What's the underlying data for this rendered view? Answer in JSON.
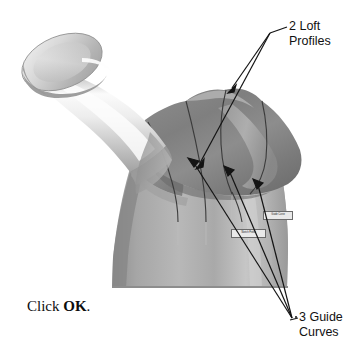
{
  "figure": {
    "background_color": "#ffffff",
    "line_color": "#141414"
  },
  "callouts": [
    {
      "name": "loft-profiles",
      "line1": "2 Loft",
      "line2": "Profiles",
      "count": 2,
      "position": "top-right"
    },
    {
      "name": "guide-curves",
      "line1": "3 Guide",
      "line2": "Curves",
      "count": 3,
      "position": "bottom-right"
    }
  ],
  "instruction": {
    "prefix": "Click ",
    "button": "OK",
    "suffix": "."
  },
  "model_flags": [
    {
      "name": "guide-curve-flag",
      "label": "Guide Curve"
    },
    {
      "name": "profile-flag",
      "label": "Sketch Profile"
    }
  ],
  "model_colors": {
    "body_light": "#d2d2d2",
    "body_mid": "#9c9c9c",
    "body_dark": "#7d7d7d",
    "top_surface": "#8b8b8b",
    "top_surface_dark": "#6f6f6f",
    "highlight": "#f4f4f4",
    "spout_light": "#efefef",
    "spout_mid": "#bdbdbd",
    "outline": "#5a5a5a"
  }
}
